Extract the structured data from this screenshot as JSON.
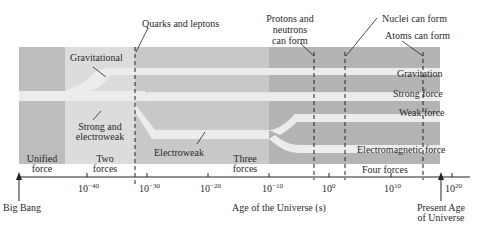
{
  "colors": {
    "unified": "#bdbdbd",
    "two_forces": "#dcdcdc",
    "electroweak": "#c8c8c8",
    "four_forces": "#b4b4b4",
    "band": "#ececec",
    "axis": "#222222"
  },
  "top_annotations": {
    "quarks": "Quarks and leptons",
    "protons_1": "Protons and",
    "protons_2": "neutrons",
    "protons_3": "can form",
    "nuclei": "Nuclei can form",
    "atoms": "Atoms can form"
  },
  "band_labels": {
    "gravitational": "Gravitational",
    "strong_electroweak_1": "Strong and",
    "strong_electroweak_2": "electroweak",
    "electroweak": "Electroweak",
    "gravitation": "Gravitation",
    "strong_force": "Strong force",
    "weak_force": "Weak force",
    "electromagnetic": "Electromagnetic force"
  },
  "eras": {
    "unified_1": "Unified",
    "unified_2": "force",
    "two_1": "Two",
    "two_2": "forces",
    "three_1": "Three",
    "three_2": "forces",
    "four": "Four forces"
  },
  "axis": {
    "title": "Age of the Universe (s)",
    "ticks": [
      {
        "base": "10",
        "exp": "−40"
      },
      {
        "base": "10",
        "exp": "−30"
      },
      {
        "base": "10",
        "exp": "−20"
      },
      {
        "base": "10",
        "exp": "−10"
      },
      {
        "base": "10",
        "exp": "0"
      },
      {
        "base": "10",
        "exp": "10"
      },
      {
        "base": "10",
        "exp": "20"
      }
    ],
    "start_label": "Big Bang",
    "end_label_1": "Present Age",
    "end_label_2": "of Universe"
  }
}
